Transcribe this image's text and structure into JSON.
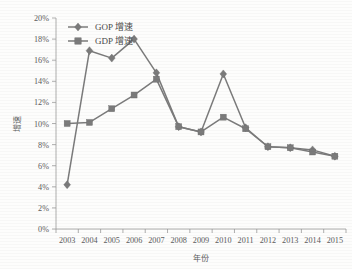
{
  "chart_data": {
    "type": "line",
    "title": "",
    "xlabel": "年份",
    "ylabel": "增速",
    "categories": [
      "2003",
      "2004",
      "2005",
      "2006",
      "2007",
      "2008",
      "2009",
      "2010",
      "2011",
      "2012",
      "2013",
      "2014",
      "2015"
    ],
    "series": [
      {
        "name": "GOP 增速",
        "marker": "diamond",
        "color": "#7b7b7b",
        "values": [
          4.2,
          16.9,
          16.2,
          18.0,
          14.8,
          9.7,
          9.2,
          14.7,
          9.6,
          7.8,
          7.7,
          7.5,
          6.9
        ]
      },
      {
        "name": "GDP 增速",
        "marker": "square",
        "color": "#7b7b7b",
        "values": [
          10.0,
          10.1,
          11.4,
          12.7,
          14.2,
          9.7,
          9.2,
          10.6,
          9.5,
          7.8,
          7.7,
          7.3,
          6.9
        ]
      }
    ],
    "ylim": [
      0,
      20
    ],
    "ytick_values": [
      0,
      2,
      4,
      6,
      8,
      10,
      12,
      14,
      16,
      18,
      20
    ],
    "ytick_labels": [
      "0%",
      "2%",
      "4%",
      "6%",
      "8%",
      "10%",
      "12%",
      "14%",
      "16%",
      "18%",
      "20%"
    ],
    "grid": false,
    "legend_position": "top-left",
    "value_suffix": "%"
  },
  "legend": {
    "entries": [
      {
        "label": "GOP 增速"
      },
      {
        "label": "GDP 增速"
      }
    ]
  },
  "axes": {
    "y_title": "增速",
    "x_title": "年份"
  }
}
